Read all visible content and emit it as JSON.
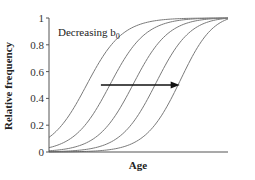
{
  "chart_data": {
    "type": "line",
    "title": "",
    "xlabel": "Age",
    "ylabel": "Relative frequency",
    "ylim": [
      0,
      1
    ],
    "xlim": [
      0,
      1
    ],
    "yticks": [
      "0",
      "0.2",
      "0.4",
      "0.6",
      "0.8",
      "1"
    ],
    "xticks": [],
    "grid": false,
    "annotation": {
      "text": "Decreasing b",
      "subscript": "0",
      "arrow": {
        "from_x": 0.29,
        "to_x": 0.73,
        "y": 0.5
      }
    },
    "series": [
      {
        "name": "curve 1",
        "midpoint": 0.21,
        "steepness": 10
      },
      {
        "name": "curve 2",
        "midpoint": 0.34,
        "steepness": 10
      },
      {
        "name": "curve 3",
        "midpoint": 0.47,
        "steepness": 10
      },
      {
        "name": "curve 4",
        "midpoint": 0.6,
        "steepness": 10
      },
      {
        "name": "curve 5",
        "midpoint": 0.75,
        "steepness": 10
      }
    ],
    "colors": {
      "curve": "#7a7a7a",
      "axis": "#555555",
      "arrow": "#111111"
    }
  }
}
